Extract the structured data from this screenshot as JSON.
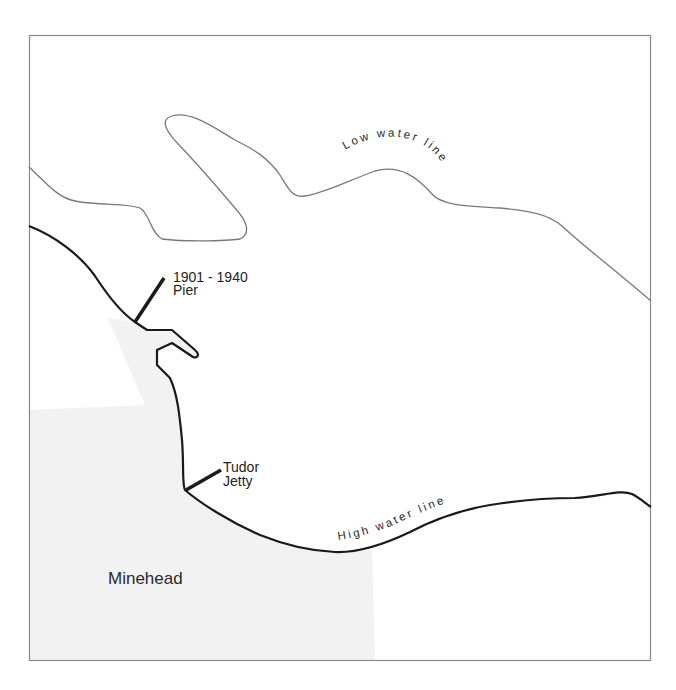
{
  "map": {
    "title": "",
    "labels": {
      "low_water_line": "Low water line",
      "high_water_line": "High water line",
      "pier_years": "1901 - 1940",
      "pier_name": "Pier",
      "jetty_line1": "Tudor",
      "jetty_line2": "Jetty",
      "town": "Minehead"
    },
    "features": [
      {
        "name": "Low water line",
        "type": "line",
        "style": "thin-gray"
      },
      {
        "name": "High water line",
        "type": "line",
        "style": "thick-black"
      },
      {
        "name": "1901 - 1940 Pier",
        "type": "marker-line"
      },
      {
        "name": "Tudor Jetty",
        "type": "marker-line"
      },
      {
        "name": "Minehead",
        "type": "town-area"
      }
    ],
    "colors": {
      "frame": "#8a8a8a",
      "low_water": "#7a7a7a",
      "high_water": "#1a1a1a",
      "town_fill": "#f2f2f2",
      "background": "#ffffff"
    }
  }
}
